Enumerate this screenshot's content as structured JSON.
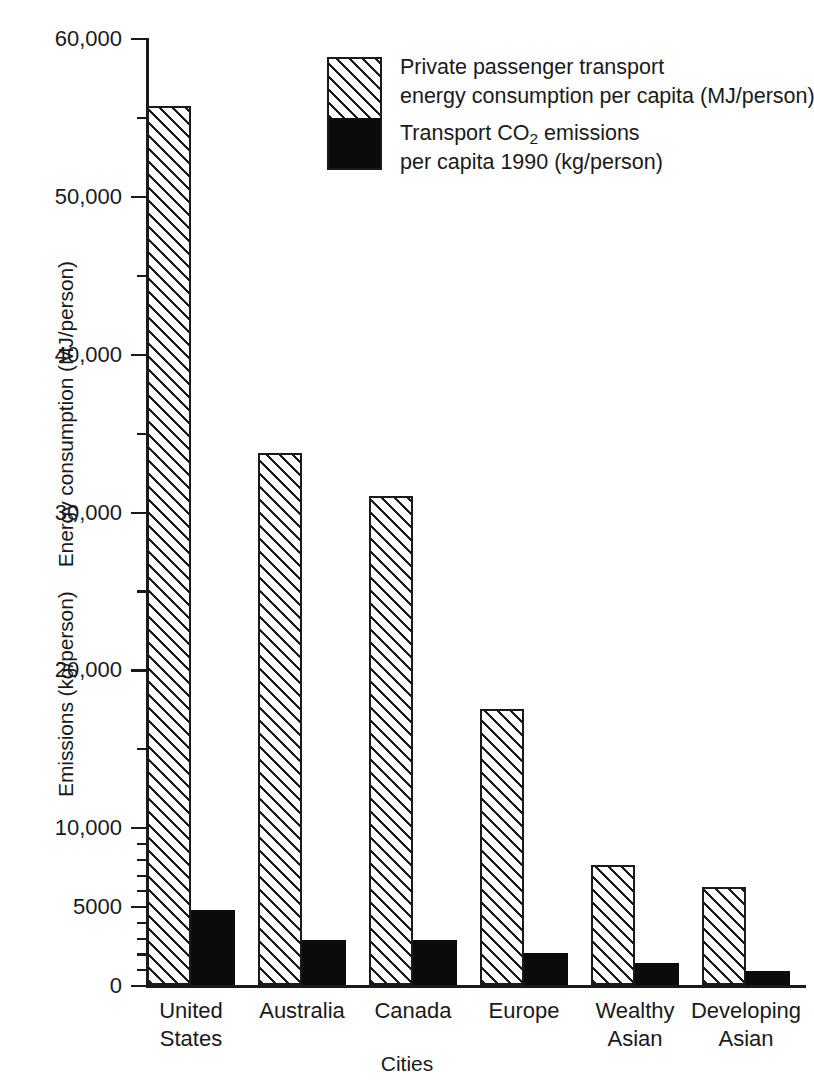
{
  "chart_data": {
    "type": "bar",
    "title": "",
    "xlabel": "Cities",
    "ylabel": "Emissions (kg/person)   Energy consumption (MJ/person)",
    "ylabel_parts": [
      "Emissions (kg/person)",
      "Energy consumption (MJ/person)"
    ],
    "categories": [
      "United States",
      "Australia",
      "Canada",
      "Europe",
      "Wealthy Asian",
      "Developing Asian"
    ],
    "category_lines": [
      [
        "United",
        "States"
      ],
      [
        "Australia",
        ""
      ],
      [
        "Canada",
        ""
      ],
      [
        "Europe",
        ""
      ],
      [
        "Wealthy",
        "Asian"
      ],
      [
        "Developing",
        "Asian"
      ]
    ],
    "series": [
      {
        "name": "Private passenger transport energy consumption per capita (MJ/person)",
        "key": "energy",
        "fill": "diagonal-hatch",
        "values": [
          55700,
          33700,
          31000,
          17500,
          7600,
          6200
        ]
      },
      {
        "name": "Transport CO2 emissions per capita 1990 (kg/person)",
        "key": "co2",
        "fill": "solid-black",
        "values": [
          4750,
          2850,
          2850,
          2000,
          1400,
          900
        ]
      }
    ],
    "ylim": [
      0,
      60000
    ],
    "ymajor_ticks": [
      0,
      5000,
      10000,
      20000,
      30000,
      40000,
      50000,
      60000
    ],
    "ymajor_tick_labels": [
      "0",
      "5000",
      "10,000",
      "20,000",
      "30,000",
      "40,000",
      "50,000",
      "60,000"
    ],
    "yminor_ticks": [
      1000,
      2000,
      3000,
      4000,
      6000,
      7000,
      8000,
      9000,
      15000,
      25000,
      35000,
      45000,
      55000
    ],
    "grid": false,
    "legend_position": "top-center"
  },
  "legend": {
    "entries": [
      {
        "swatch": "diagonal-hatch",
        "line1": "Private passenger transport",
        "line2": "energy consumption per capita (MJ/person)"
      },
      {
        "swatch": "solid-black",
        "line1_pre": "Transport CO",
        "line1_sub": "2",
        "line1_post": " emissions",
        "line2": "per capita 1990 (kg/person)"
      }
    ]
  },
  "colors": {
    "ink": "#1a1a1a",
    "solid_bar": "#0b0b0b",
    "background": "#ffffff"
  }
}
